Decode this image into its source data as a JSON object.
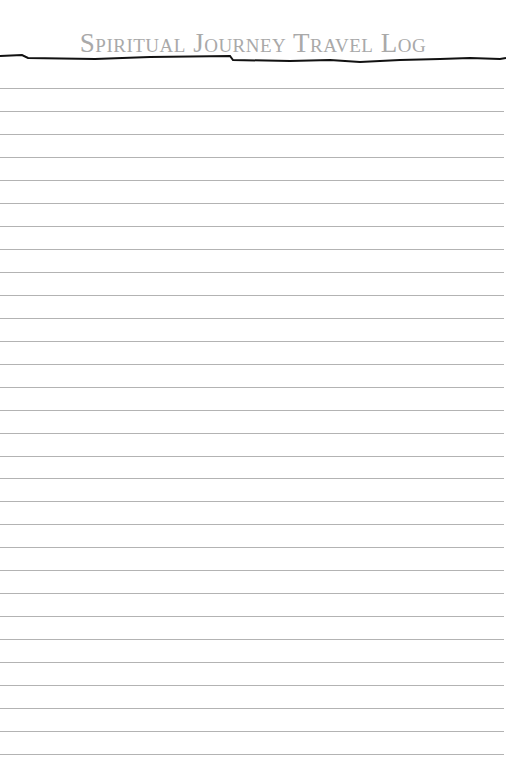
{
  "page": {
    "title": "Spiritual Journey Travel Log",
    "rule_color": "#111111",
    "line_color": "#b3b3b3",
    "line_count": 30,
    "first_line_y": 88,
    "line_spacing": 22.97
  }
}
